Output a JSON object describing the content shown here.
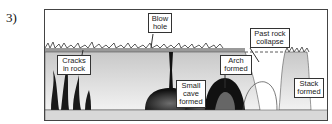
{
  "question_number": "3)",
  "diagram": {
    "labels": {
      "cracks": "Cracks in rock",
      "blowhole": "Blow hole",
      "small_cave": "Small cave formed",
      "arch": "Arch formed",
      "past_collapse": "Past rock collapse",
      "stack": "Stack formed"
    },
    "colors": {
      "rock_dark": "#1a1a1a",
      "rock_grey": "#7a7a7a",
      "ground": "#a9a9a9",
      "sea_floor": "#d8d8d8"
    }
  }
}
